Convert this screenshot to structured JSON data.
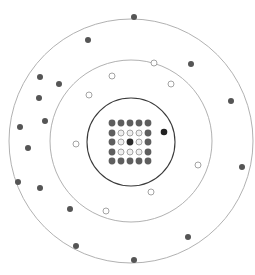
{
  "diagram": {
    "width": 255,
    "height": 275,
    "center": [
      131,
      141
    ],
    "colors": {
      "outer_ring_stroke": "#a8a8a8",
      "middle_ring_stroke": "#a8a8a8",
      "inner_ring_stroke": "#3a3a3a",
      "filled_dot": "#555555",
      "grid_filled_dot": "#5e5e5e",
      "open_dot_stroke": "#9a9a9a",
      "open_dot_fill": "#ffffff",
      "grid_open_fill": "#efefef",
      "center_dot": "#2a2a2a",
      "inner_dark_dot": "#222222"
    },
    "rings": [
      {
        "name": "outer-ring",
        "cx": 131,
        "cy": 141,
        "r": 122,
        "stroke": "#a8a8a8",
        "width": 0.9
      },
      {
        "name": "middle-ring",
        "cx": 131,
        "cy": 141,
        "r": 81,
        "stroke": "#a8a8a8",
        "width": 0.9
      },
      {
        "name": "inner-ring",
        "cx": 131,
        "cy": 142,
        "r": 44,
        "stroke": "#3a3a3a",
        "width": 1.1
      }
    ],
    "outer_dots": [
      [
        134,
        17
      ],
      [
        88,
        40
      ],
      [
        191,
        64
      ],
      [
        40,
        77
      ],
      [
        59,
        84
      ],
      [
        39,
        98
      ],
      [
        231,
        101
      ],
      [
        45,
        121
      ],
      [
        20,
        127
      ],
      [
        28,
        148
      ],
      [
        242,
        167
      ],
      [
        18,
        182
      ],
      [
        40,
        188
      ],
      [
        70,
        209
      ],
      [
        188,
        237
      ],
      [
        76,
        246
      ],
      [
        134,
        260
      ]
    ],
    "middle_open_dots": [
      [
        154,
        63
      ],
      [
        112,
        76
      ],
      [
        171,
        84
      ],
      [
        89,
        95
      ],
      [
        76,
        144
      ],
      [
        198,
        165
      ],
      [
        151,
        192
      ],
      [
        106,
        211
      ]
    ],
    "inner_dark_dots": [
      [
        164,
        132
      ]
    ],
    "grid": {
      "cols": [
        112,
        121,
        130,
        139,
        148
      ],
      "rows": [
        123,
        133,
        142,
        152,
        161
      ],
      "pattern": [
        [
          "F",
          "F",
          "F",
          "F",
          "F"
        ],
        [
          "F",
          "O",
          "O",
          "O",
          "F"
        ],
        [
          "F",
          "O",
          "C",
          "O",
          "F"
        ],
        [
          "F",
          "O",
          "O",
          "O",
          "F"
        ],
        [
          "F",
          "F",
          "F",
          "F",
          "F"
        ]
      ],
      "legend": {
        "F": "filled",
        "O": "open",
        "C": "center"
      }
    },
    "dot_radius": 3,
    "grid_dot_radius": 3.4
  }
}
